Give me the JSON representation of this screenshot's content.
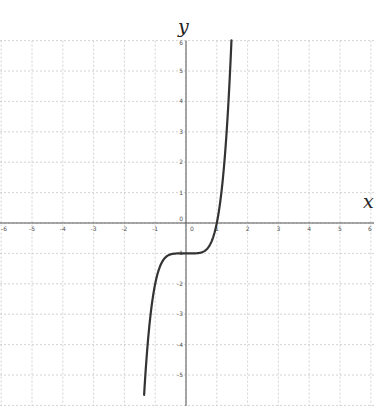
{
  "chart_data": {
    "type": "line",
    "title": "",
    "xlabel": "x",
    "ylabel": "y",
    "xlim": [
      -6,
      6
    ],
    "ylim": [
      -6,
      6
    ],
    "grid": true,
    "grid_style": "dashed",
    "x_ticks": [
      -6,
      -5,
      -4,
      -3,
      -2,
      -1,
      0,
      1,
      2,
      3,
      4,
      5,
      6
    ],
    "y_ticks": [
      -5,
      -4,
      -3,
      -2,
      -1,
      0,
      1,
      2,
      3,
      4,
      5,
      6
    ],
    "series": [
      {
        "name": "y = x^5 - 1",
        "color": "#333333",
        "x": [
          -1.36,
          -1.3,
          -1.25,
          -1.2,
          -1.1,
          -1.0,
          -0.9,
          -0.8,
          -0.6,
          -0.4,
          0,
          0.4,
          0.6,
          0.8,
          0.9,
          1.0,
          1.1,
          1.2,
          1.3,
          1.4,
          1.476
        ],
        "y": [
          -5.66,
          -4.71,
          -4.05,
          -3.49,
          -2.61,
          -2.0,
          -1.59,
          -1.33,
          -1.08,
          -1.01,
          -1.0,
          -0.99,
          -0.92,
          -0.67,
          -0.41,
          0.0,
          0.61,
          1.49,
          2.71,
          4.38,
          6.0
        ]
      }
    ],
    "legend": null
  },
  "colors": {
    "grid": "#c8c8c8",
    "axis": "#555555",
    "curve": "#333333"
  }
}
